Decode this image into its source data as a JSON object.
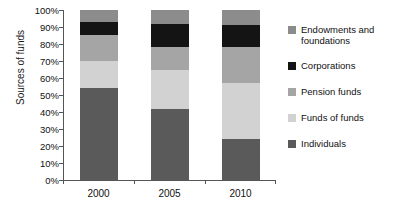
{
  "chart_data": {
    "type": "bar",
    "subtype": "stacked-percentage-column",
    "title": "",
    "xlabel": "",
    "ylabel": "Sources of funds",
    "categories": [
      "2000",
      "2005",
      "2010"
    ],
    "ylim": [
      0,
      100
    ],
    "y_unit": "%",
    "ytick_labels": [
      "0%",
      "10%",
      "20%",
      "30%",
      "40%",
      "50%",
      "60%",
      "70%",
      "80%",
      "90%",
      "100%"
    ],
    "ytick_values": [
      0,
      10,
      20,
      30,
      40,
      50,
      60,
      70,
      80,
      90,
      100
    ],
    "grid": false,
    "legend_position": "right",
    "stack_order_bottom_to_top": [
      "Individuals",
      "Funds of funds",
      "Pension funds",
      "Corporations",
      "Endowments and foundations"
    ],
    "series": [
      {
        "name": "Individuals",
        "color": "#5a5a5a",
        "values": [
          54,
          42,
          24
        ]
      },
      {
        "name": "Funds of funds",
        "color": "#d2d2d2",
        "values": [
          16,
          23,
          33
        ]
      },
      {
        "name": "Pension funds",
        "color": "#a5a5a5",
        "values": [
          15.5,
          13,
          21
        ]
      },
      {
        "name": "Corporations",
        "color": "#141414",
        "values": [
          7.5,
          14,
          13
        ]
      },
      {
        "name": "Endowments and foundations",
        "color": "#8c8c8c",
        "values": [
          7,
          8,
          9
        ]
      }
    ],
    "cumulative_tops": {
      "2000": [
        54,
        70,
        85.5,
        93,
        100
      ],
      "2005": [
        42,
        65,
        78,
        92,
        100
      ],
      "2010": [
        24,
        57,
        78,
        91,
        100
      ]
    }
  },
  "axis": {
    "y_title": "Sources of funds"
  },
  "legend": {
    "entries": [
      {
        "label": "Endowments and foundations",
        "color": "#8c8c8c"
      },
      {
        "label": "Corporations",
        "color": "#141414"
      },
      {
        "label": "Pension funds",
        "color": "#a5a5a5"
      },
      {
        "label": "Funds of funds",
        "color": "#d2d2d2"
      },
      {
        "label": "Individuals",
        "color": "#5a5a5a"
      }
    ]
  }
}
